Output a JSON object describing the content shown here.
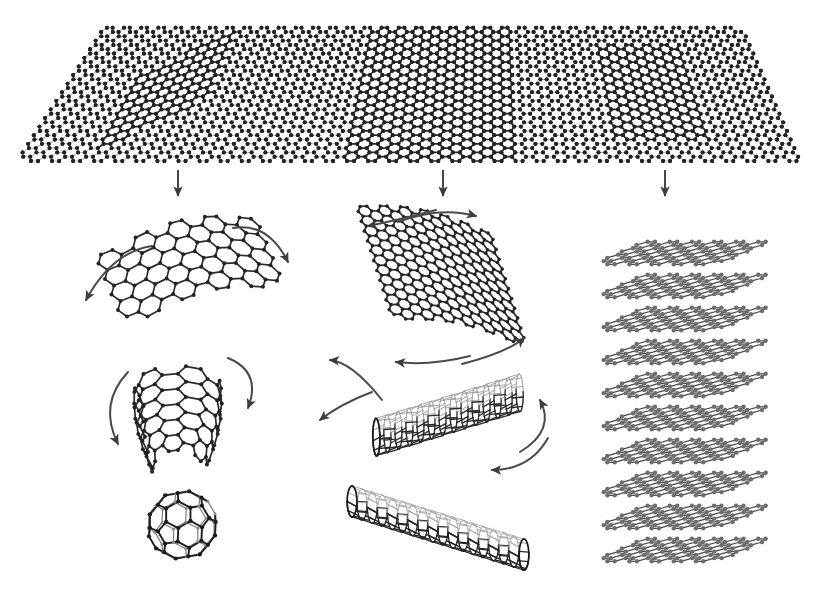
{
  "figure": {
    "title": "Carbon allotropes derived from a two-dimensional graphene sheet",
    "background_color": "#ffffff",
    "width": 823,
    "height": 592,
    "line_color_highlight": "#232323",
    "line_color_faint": "#c4c4c4",
    "line_color_mid": "#6d6d6d"
  },
  "source_sheet": {
    "name": "graphene-mother-sheet",
    "description": "Large hexagonal carbon lattice drawn in perspective as a trapezoid",
    "lattice": "honeycomb",
    "perspective": "trapezoid, narrow at top edge and wide at bottom edge",
    "top_edge_y": 32,
    "bottom_edge_y": 161,
    "top_edge_x_start": 107,
    "top_edge_x_end": 744,
    "bottom_edge_x_start": 24,
    "bottom_edge_x_end": 800,
    "highlighted_patches": [
      {
        "name": "patch-fullerene",
        "label": "small diagonal flake",
        "center_x": 196,
        "center_y": 88,
        "columns": 7,
        "rows": 4,
        "becomes": "fullerene"
      },
      {
        "name": "patch-nanotube",
        "label": "large rectangular patch",
        "center_x": 448,
        "center_y": 90,
        "columns": 12,
        "rows": 9,
        "becomes": "nanotube"
      },
      {
        "name": "patch-graphite",
        "label": "medium rectangular patch",
        "center_x": 665,
        "center_y": 92,
        "columns": 7,
        "rows": 5,
        "becomes": "graphite"
      }
    ]
  },
  "descent_arrows": [
    {
      "name": "descent-arrow-left",
      "x": 178,
      "y_start": 170,
      "y_end": 196
    },
    {
      "name": "descent-arrow-center",
      "x": 443,
      "y_start": 170,
      "y_end": 196
    },
    {
      "name": "descent-arrow-right",
      "x": 665,
      "y_start": 170,
      "y_end": 196
    }
  ],
  "columns": [
    {
      "name": "column-fullerene",
      "dimensionality": "0D",
      "product": "fullerene",
      "stages": [
        {
          "name": "stage-curving-flake",
          "caption": "flat flake begins to curve",
          "center_x": 185,
          "center_y": 275
        },
        {
          "name": "stage-hemisphere-bowl",
          "caption": "flake closes into a bowl",
          "center_x": 178,
          "center_y": 410
        },
        {
          "name": "stage-buckyball",
          "caption": "closed cage",
          "center_x": 182,
          "center_y": 525
        }
      ],
      "curved_arrow_count": 4
    },
    {
      "name": "column-nanotube",
      "dimensionality": "1D",
      "product": "carbon nanotube",
      "stages": [
        {
          "name": "stage-curved-sheet",
          "caption": "sheet curls about its axis",
          "center_x": 445,
          "center_y": 283
        },
        {
          "name": "stage-open-tube",
          "caption": "sheet wraps into open tube",
          "center_x": 448,
          "center_y": 415
        },
        {
          "name": "stage-closed-tube",
          "caption": "seamless cylinder",
          "center_x": 438,
          "center_y": 528
        }
      ],
      "curved_arrow_count": 6
    },
    {
      "name": "column-graphite",
      "dimensionality": "3D",
      "product": "graphite",
      "stages": [
        {
          "name": "stage-layer-stack",
          "caption": "sheets stack in register",
          "center_x": 675,
          "center_y": 390
        }
      ],
      "layer_count": 10,
      "layer_top_y": 245,
      "layer_spacing": 33,
      "curved_arrow_count": 0
    }
  ]
}
